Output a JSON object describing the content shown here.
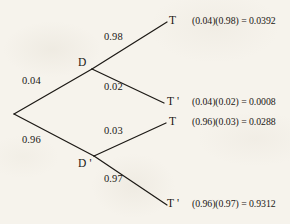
{
  "diagram": {
    "type": "probability-tree",
    "title": "",
    "background_color": "#f6f3ec",
    "ink_color": "#1c1915",
    "root": {
      "label": ""
    },
    "level1": [
      {
        "id": "D",
        "node_label": "D",
        "probability": "0.04"
      },
      {
        "id": "Dp",
        "node_label": "D '",
        "probability": "0.96"
      }
    ],
    "level2": [
      {
        "parent": "D",
        "node_label": "T",
        "probability": "0.98"
      },
      {
        "parent": "D",
        "node_label": "T '",
        "probability": "0.02"
      },
      {
        "parent": "Dp",
        "node_label": "T",
        "probability": "0.03"
      },
      {
        "parent": "Dp",
        "node_label": "T '",
        "probability": "0.97"
      }
    ],
    "outcomes": [
      {
        "expression": "(0.04)(0.98) = 0.0392"
      },
      {
        "expression": "(0.04)(0.02) = 0.0008"
      },
      {
        "expression": "(0.96)(0.03) = 0.0288"
      },
      {
        "expression": "(0.96)(0.97) = 0.9312"
      }
    ]
  }
}
